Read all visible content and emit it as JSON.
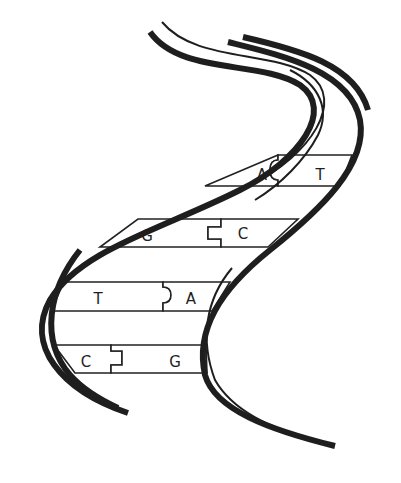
{
  "diagram": {
    "type": "dna-double-helix",
    "colors": {
      "stroke": "#1e1e1e",
      "background": "#ffffff"
    },
    "base_pairs": [
      {
        "left": "A",
        "right": "T",
        "connector": "round"
      },
      {
        "left": "G",
        "right": "C",
        "connector": "square"
      },
      {
        "left": "T",
        "right": "A",
        "connector": "round"
      },
      {
        "left": "C",
        "right": "G",
        "connector": "square"
      }
    ]
  }
}
